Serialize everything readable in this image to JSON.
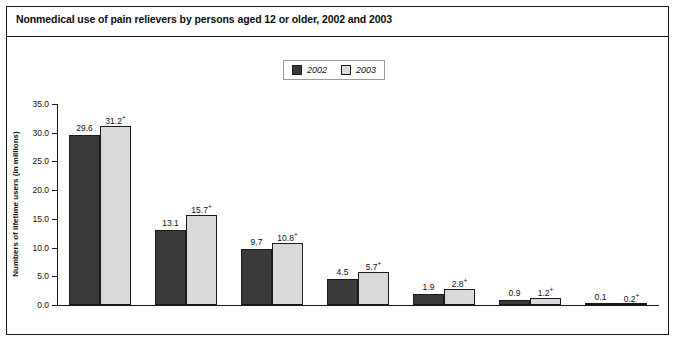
{
  "title": "Nonmedical use of pain relievers by persons aged 12 or older, 2002 and 2003",
  "legend": {
    "items": [
      {
        "label": "2002",
        "color": "#3b3b3b"
      },
      {
        "label": "2003",
        "color": "#d9d9d9"
      }
    ]
  },
  "chart_data": {
    "type": "bar",
    "title": "Nonmedical use of pain relievers by persons aged 12 or older, 2002 and 2003",
    "xlabel": "",
    "ylabel": "Numbers of lifetime users (in millions)",
    "ylim": [
      0,
      35
    ],
    "ytick_labels": [
      "0.0",
      "5.0",
      "10.0",
      "15.0",
      "20.0",
      "25.0",
      "30.0",
      "35.0"
    ],
    "ytick_values": [
      0,
      5,
      10,
      15,
      20,
      25,
      30,
      35
    ],
    "grid": false,
    "legend_position": "top-center",
    "categories": [
      "Any pain reliever",
      "Vicodin®, Lortab®, or Lorcet®",
      "Percocet®, Percodan®, or Tylox®",
      "Hydrocodone",
      "OxyContin®",
      "Methadone",
      "Tramadol"
    ],
    "category_lines": [
      [
        "Any pain reliever"
      ],
      [
        "Vicodin®, Lortab®,",
        "or Lorcet®"
      ],
      [
        "Percocet®, Percodan®,",
        "or Tylox®"
      ],
      [
        "Hydrocodone"
      ],
      [
        "OxyContin®"
      ],
      [
        "Methadone"
      ],
      [
        "Tramadol"
      ]
    ],
    "series": [
      {
        "name": "2002",
        "color": "#3b3b3b",
        "values": [
          29.6,
          13.1,
          9.7,
          4.5,
          1.9,
          0.9,
          0.1
        ],
        "labels": [
          "29.6",
          "13.1",
          "9.7",
          "4.5",
          "1.9",
          "0.9",
          "0.1"
        ],
        "markers": [
          "",
          "",
          "",
          "",
          "",
          "",
          ""
        ]
      },
      {
        "name": "2003",
        "color": "#d9d9d9",
        "values": [
          31.2,
          15.7,
          10.8,
          5.7,
          2.8,
          1.2,
          0.2
        ],
        "labels": [
          "31.2",
          "15.7",
          "10.8",
          "5.7",
          "2.8",
          "1.2",
          "0.2"
        ],
        "markers": [
          "+",
          "+",
          "+",
          "+",
          "+",
          "+",
          "+"
        ]
      }
    ]
  }
}
